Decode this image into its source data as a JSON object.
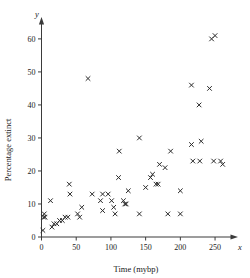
{
  "chart_data": {
    "type": "scatter",
    "title": "",
    "subtitle": "",
    "xlabel": "Time (mybp)",
    "ylabel": "Percentage extinct",
    "x_axis_variable": "x",
    "y_axis_variable": "y",
    "xlim": [
      -10,
      275
    ],
    "ylim": [
      -2,
      66
    ],
    "xticks": [
      0,
      50,
      100,
      150,
      200,
      250
    ],
    "yticks": [
      0,
      10,
      20,
      30,
      40,
      50,
      60
    ],
    "xtick_labels": [
      "0",
      "50",
      "100",
      "150",
      "200",
      "250"
    ],
    "ytick_labels": [
      "0",
      "10",
      "20",
      "30",
      "40",
      "50",
      "60"
    ],
    "grid": false,
    "legend": false,
    "legend_position": "none",
    "marker": "x",
    "marker_color": "#2b2b2b",
    "n_points": 57,
    "points": [
      [
        2,
        2
      ],
      [
        3,
        6
      ],
      [
        4,
        7
      ],
      [
        5,
        6
      ],
      [
        13,
        11
      ],
      [
        15,
        3
      ],
      [
        18,
        4
      ],
      [
        22,
        4
      ],
      [
        26,
        5
      ],
      [
        30,
        5
      ],
      [
        34,
        6
      ],
      [
        38,
        6
      ],
      [
        40,
        16
      ],
      [
        41,
        13
      ],
      [
        52,
        7
      ],
      [
        55,
        6
      ],
      [
        58,
        9
      ],
      [
        67,
        48
      ],
      [
        73,
        13
      ],
      [
        85,
        11
      ],
      [
        88,
        13
      ],
      [
        88,
        8
      ],
      [
        101,
        11
      ],
      [
        104,
        9
      ],
      [
        106,
        7
      ],
      [
        112,
        26
      ],
      [
        111,
        18
      ],
      [
        118,
        11
      ],
      [
        122,
        10
      ],
      [
        125,
        14
      ],
      [
        141,
        30
      ],
      [
        141,
        7
      ],
      [
        150,
        15
      ],
      [
        157,
        18
      ],
      [
        160,
        19
      ],
      [
        168,
        16
      ],
      [
        170,
        22
      ],
      [
        178,
        21
      ],
      [
        182,
        7
      ],
      [
        186,
        26
      ],
      [
        200,
        14
      ],
      [
        200,
        7
      ],
      [
        216,
        46
      ],
      [
        216,
        28
      ],
      [
        218,
        23
      ],
      [
        227,
        40
      ],
      [
        228,
        23
      ],
      [
        230,
        29
      ],
      [
        242,
        45
      ],
      [
        245,
        60
      ],
      [
        250,
        61
      ],
      [
        248,
        23
      ],
      [
        258,
        23
      ],
      [
        261,
        22
      ],
      [
        165,
        16
      ],
      [
        96,
        13
      ],
      [
        120,
        10
      ]
    ]
  }
}
